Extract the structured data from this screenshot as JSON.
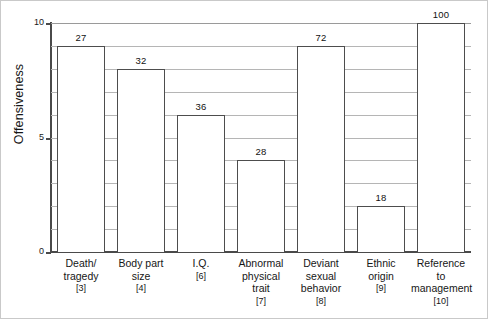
{
  "chart_data": {
    "type": "bar",
    "title": "",
    "xlabel": "",
    "ylabel": "Offensiveness",
    "ylim": [
      0,
      10
    ],
    "yticks": [
      0,
      5,
      10
    ],
    "ytick_labels": [
      "0",
      "5",
      "10"
    ],
    "gridlines": [
      1,
      2,
      3,
      4,
      5,
      6,
      7,
      8,
      9,
      10
    ],
    "grid": true,
    "legend": "none",
    "categories": [
      "Death/ tragedy",
      "Body part size",
      "I.Q.",
      "Abnormal physical trait",
      "Deviant sexual behavior",
      "Ethnic origin",
      "Reference to management"
    ],
    "category_lines": [
      [
        "Death/",
        "tragedy"
      ],
      [
        "Body part",
        "size"
      ],
      [
        "I.Q."
      ],
      [
        "Abnormal",
        "physical",
        "trait"
      ],
      [
        "Deviant",
        "sexual",
        "behavior"
      ],
      [
        "Ethnic",
        "origin"
      ],
      [
        "Reference to",
        "management"
      ]
    ],
    "category_refs": [
      "[3]",
      "[4]",
      "[6]",
      "[7]",
      "[8]",
      "[9]",
      "[10]"
    ],
    "values": [
      9,
      8,
      6,
      4,
      9,
      2,
      10
    ],
    "data_labels": [
      "27",
      "32",
      "36",
      "28",
      "72",
      "18",
      "100"
    ],
    "bar_fill": "#ffffff",
    "bar_edge": "#4d4d4d",
    "grid_color": "#b5b5b5",
    "axis_color": "#4a4a4a",
    "text_color": "#161616"
  }
}
